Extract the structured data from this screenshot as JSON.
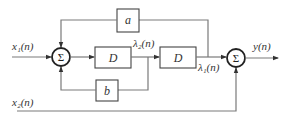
{
  "diagram": {
    "type": "signal-flow block diagram",
    "inputs": {
      "x1": "x₁(n)",
      "x2": "x₂(n)"
    },
    "output": "y(n)",
    "states": {
      "lambda2": "λ₂(n)",
      "lambda1": "λ₁(n)"
    },
    "blocks": {
      "delay1": "D",
      "delay2": "D",
      "gain_a": "a",
      "gain_b": "b"
    },
    "summers": {
      "sum1": "Σ",
      "sum2": "Σ"
    },
    "connections": [
      {
        "from": "x1",
        "to": "sum1"
      },
      {
        "from": "sum1",
        "to": "delay1"
      },
      {
        "from": "delay1",
        "to": "lambda2"
      },
      {
        "from": "lambda2",
        "to": "delay2"
      },
      {
        "from": "lambda2",
        "to": "gain_b"
      },
      {
        "from": "gain_b",
        "to": "sum1"
      },
      {
        "from": "delay2",
        "to": "lambda1"
      },
      {
        "from": "lambda1",
        "to": "gain_a"
      },
      {
        "from": "gain_a",
        "to": "sum1"
      },
      {
        "from": "lambda1",
        "to": "sum2"
      },
      {
        "from": "x2",
        "to": "sum2"
      },
      {
        "from": "sum2",
        "to": "y"
      }
    ],
    "colors": {
      "wire": "#7a7a7a",
      "box": "#444444",
      "text": "#333333"
    }
  }
}
